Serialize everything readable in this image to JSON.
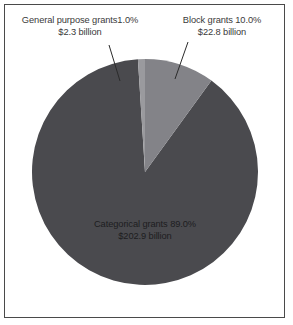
{
  "figure": {
    "name": "federal-grants-pie-chart",
    "background_color": "#ffffff",
    "frame_color": "#4a4a4a",
    "text_color": "#3a3a3a",
    "slice_text_color": "#1d1d1f"
  },
  "callouts": {
    "general_purpose": {
      "line1": "General purpose grants1.0%",
      "line2": "$2.3 billion"
    },
    "block": {
      "line1": "Block grants 10.0%",
      "line2": "$22.8 billion"
    }
  },
  "slice_labels": {
    "categorical": {
      "line1": "Categorical grants 89.0%",
      "line2": "$202.9 billion"
    }
  },
  "chart_data": {
    "type": "pie",
    "title": "",
    "subtitle": "",
    "xlabel": "",
    "ylabel": "",
    "legend_position": "none",
    "grid": false,
    "units": "billions of dollars",
    "start_angle_deg": 0,
    "direction": "clockwise",
    "center_px": [
      145,
      172
    ],
    "radius_px": 113,
    "slices": [
      {
        "label": "Block grants",
        "percent": 10.0,
        "percent_text": "10.0%",
        "value": 22.8,
        "value_text": "$22.8 billion",
        "color": "#838388",
        "label_placement": "callout-top-right"
      },
      {
        "label": "Categorical grants",
        "percent": 89.0,
        "percent_text": "89.0%",
        "value": 202.9,
        "value_text": "$202.9 billion",
        "color": "#4a4a4e",
        "label_placement": "inside"
      },
      {
        "label": "General purpose grants",
        "percent": 1.0,
        "percent_text": "1.0%",
        "value": 2.3,
        "value_text": "$2.3 billion",
        "color": "#9a9a9e",
        "label_placement": "callout-top-left"
      }
    ],
    "total_value": 228.0
  }
}
